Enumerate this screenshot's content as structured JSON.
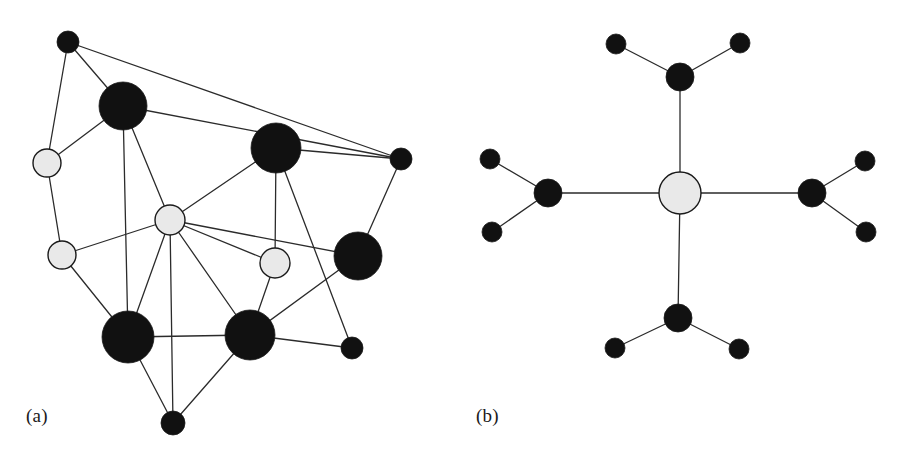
{
  "figure": {
    "width": 900,
    "height": 472,
    "background": "#ffffff",
    "caption_font_size": 19
  },
  "style": {
    "node_black_fill": "#111111",
    "node_gray_fill": "#e9e9e9",
    "node_stroke": "#1a1a1a",
    "node_stroke_width": 1.4,
    "edge_color": "#2b2b2b",
    "edge_width": 1.3
  },
  "panels": [
    {
      "id": "panel-a",
      "label": "(a)",
      "label_x": 26,
      "label_y": 405,
      "description": "irregular social network graph"
    },
    {
      "id": "panel-b",
      "label": "(b)",
      "label_x": 476,
      "label_y": 405,
      "description": "symmetric star / hub-and-spoke graph"
    }
  ],
  "chart_data": {
    "type": "diagram",
    "subtype": "node-link-graph",
    "title": "",
    "panels": [
      {
        "id": "a",
        "label": "(a)",
        "nodes": [
          {
            "id": "a1",
            "x": 68,
            "y": 42,
            "r": 11,
            "color": "black",
            "size": "small"
          },
          {
            "id": "a2",
            "x": 123,
            "y": 106,
            "r": 24,
            "color": "black",
            "size": "large"
          },
          {
            "id": "a3",
            "x": 47,
            "y": 163,
            "r": 14,
            "color": "gray",
            "size": "medium"
          },
          {
            "id": "a4",
            "x": 62,
            "y": 255,
            "r": 14,
            "color": "gray",
            "size": "medium"
          },
          {
            "id": "a5",
            "x": 170,
            "y": 220,
            "r": 15,
            "color": "gray",
            "size": "medium"
          },
          {
            "id": "a6",
            "x": 276,
            "y": 148,
            "r": 25,
            "color": "black",
            "size": "large"
          },
          {
            "id": "a7",
            "x": 401,
            "y": 159,
            "r": 11,
            "color": "black",
            "size": "small"
          },
          {
            "id": "a8",
            "x": 275,
            "y": 263,
            "r": 15,
            "color": "gray",
            "size": "medium"
          },
          {
            "id": "a9",
            "x": 358,
            "y": 256,
            "r": 24,
            "color": "black",
            "size": "large"
          },
          {
            "id": "a10",
            "x": 128,
            "y": 337,
            "r": 26,
            "color": "black",
            "size": "large"
          },
          {
            "id": "a11",
            "x": 250,
            "y": 335,
            "r": 25,
            "color": "black",
            "size": "large"
          },
          {
            "id": "a12",
            "x": 352,
            "y": 348,
            "r": 11,
            "color": "black",
            "size": "small"
          },
          {
            "id": "a13",
            "x": 173,
            "y": 423,
            "r": 12,
            "color": "black",
            "size": "small"
          }
        ],
        "edges": [
          [
            "a1",
            "a2"
          ],
          [
            "a1",
            "a3"
          ],
          [
            "a1",
            "a7"
          ],
          [
            "a2",
            "a3"
          ],
          [
            "a2",
            "a7"
          ],
          [
            "a2",
            "a5"
          ],
          [
            "a2",
            "a10"
          ],
          [
            "a3",
            "a4"
          ],
          [
            "a4",
            "a5"
          ],
          [
            "a4",
            "a10"
          ],
          [
            "a5",
            "a6"
          ],
          [
            "a5",
            "a8"
          ],
          [
            "a5",
            "a9"
          ],
          [
            "a5",
            "a10"
          ],
          [
            "a5",
            "a11"
          ],
          [
            "a5",
            "a13"
          ],
          [
            "a6",
            "a8"
          ],
          [
            "a6",
            "a7"
          ],
          [
            "a6",
            "a12"
          ],
          [
            "a7",
            "a9"
          ],
          [
            "a8",
            "a11"
          ],
          [
            "a9",
            "a11"
          ],
          [
            "a10",
            "a11"
          ],
          [
            "a10",
            "a13"
          ],
          [
            "a11",
            "a12"
          ],
          [
            "a11",
            "a13"
          ]
        ]
      },
      {
        "id": "b",
        "label": "(b)",
        "nodes": [
          {
            "id": "b0",
            "x": 680,
            "y": 193,
            "r": 21,
            "color": "gray",
            "size": "hub",
            "role": "hub"
          },
          {
            "id": "b1",
            "x": 680,
            "y": 77,
            "r": 14,
            "color": "black",
            "size": "medium",
            "role": "branch"
          },
          {
            "id": "b2",
            "x": 548,
            "y": 193,
            "r": 14,
            "color": "black",
            "size": "medium",
            "role": "branch"
          },
          {
            "id": "b3",
            "x": 812,
            "y": 193,
            "r": 14,
            "color": "black",
            "size": "medium",
            "role": "branch"
          },
          {
            "id": "b4",
            "x": 678,
            "y": 318,
            "r": 14,
            "color": "black",
            "size": "medium",
            "role": "branch"
          },
          {
            "id": "b1a",
            "x": 616,
            "y": 44,
            "r": 10,
            "color": "black",
            "size": "small",
            "role": "leaf"
          },
          {
            "id": "b1b",
            "x": 740,
            "y": 43,
            "r": 10,
            "color": "black",
            "size": "small",
            "role": "leaf"
          },
          {
            "id": "b2a",
            "x": 490,
            "y": 159,
            "r": 10,
            "color": "black",
            "size": "small",
            "role": "leaf"
          },
          {
            "id": "b2b",
            "x": 492,
            "y": 232,
            "r": 10,
            "color": "black",
            "size": "small",
            "role": "leaf"
          },
          {
            "id": "b3a",
            "x": 865,
            "y": 161,
            "r": 10,
            "color": "black",
            "size": "small",
            "role": "leaf"
          },
          {
            "id": "b3b",
            "x": 866,
            "y": 232,
            "r": 10,
            "color": "black",
            "size": "small",
            "role": "leaf"
          },
          {
            "id": "b4a",
            "x": 615,
            "y": 348,
            "r": 10,
            "color": "black",
            "size": "small",
            "role": "leaf"
          },
          {
            "id": "b4b",
            "x": 739,
            "y": 349,
            "r": 10,
            "color": "black",
            "size": "small",
            "role": "leaf"
          }
        ],
        "edges": [
          [
            "b0",
            "b1"
          ],
          [
            "b0",
            "b2"
          ],
          [
            "b0",
            "b3"
          ],
          [
            "b0",
            "b4"
          ],
          [
            "b1",
            "b1a"
          ],
          [
            "b1",
            "b1b"
          ],
          [
            "b2",
            "b2a"
          ],
          [
            "b2",
            "b2b"
          ],
          [
            "b3",
            "b3a"
          ],
          [
            "b3",
            "b3b"
          ],
          [
            "b4",
            "b4a"
          ],
          [
            "b4",
            "b4b"
          ]
        ]
      }
    ]
  }
}
